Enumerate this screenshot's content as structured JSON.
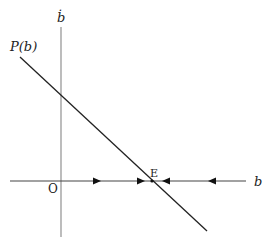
{
  "diagram": {
    "y_axis_label": "ḃ",
    "x_axis_label": "b",
    "origin_label": "O",
    "curve_label": "P(b)",
    "equilibrium_label": "E",
    "colors": {
      "axis": "#999999",
      "line": "#222222",
      "text": "#222222"
    }
  }
}
